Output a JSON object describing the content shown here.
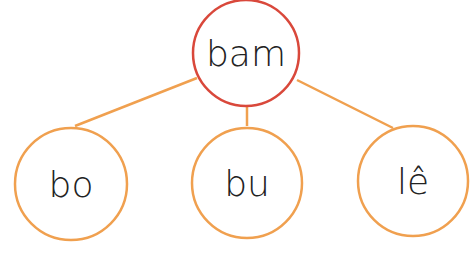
{
  "diagram": {
    "type": "tree",
    "colors": {
      "root_stroke": "#d9483b",
      "child_stroke": "#f0a04f",
      "edge": "#f0a04f",
      "text": "#222222",
      "background": "#ffffff"
    },
    "root": {
      "label": "bam"
    },
    "children": [
      {
        "label": "bo"
      },
      {
        "label": "bu"
      },
      {
        "label": "lê"
      }
    ]
  }
}
